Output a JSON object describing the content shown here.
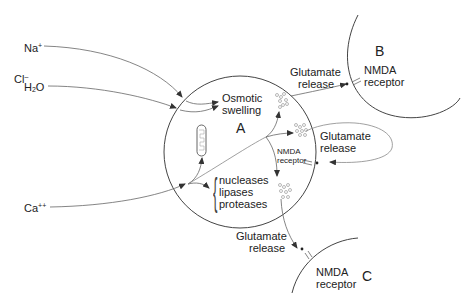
{
  "ions": {
    "na": {
      "base": "Na",
      "charge": "+"
    },
    "cl": {
      "base": "Cl",
      "charge": "–"
    },
    "h2o": {
      "h": "H",
      "sub": "2",
      "o": "O"
    },
    "ca": {
      "base": "Ca",
      "charge": "++"
    }
  },
  "cell_a": {
    "label": "A",
    "osmotic_line1": "Osmotic",
    "osmotic_line2": "swelling",
    "enzymes": [
      "nucleases",
      "lipases",
      "proteases"
    ],
    "internal_receptor_line1": "NMDA",
    "internal_receptor_line2": "receptor",
    "autocrine_release_line1": "Glutamate",
    "autocrine_release_line2": "release"
  },
  "cell_b": {
    "label": "B",
    "receptor_line1": "NMDA",
    "receptor_line2": "receptor",
    "release_line1": "Glutamate",
    "release_line2": "release"
  },
  "cell_c": {
    "label": "C",
    "receptor_line1": "NMDA",
    "receptor_line2": "receptor",
    "release_line1": "Glutamate",
    "release_line2": "release"
  },
  "colors": {
    "line": "#555555",
    "text": "#222222",
    "vesicle": "#999999"
  }
}
